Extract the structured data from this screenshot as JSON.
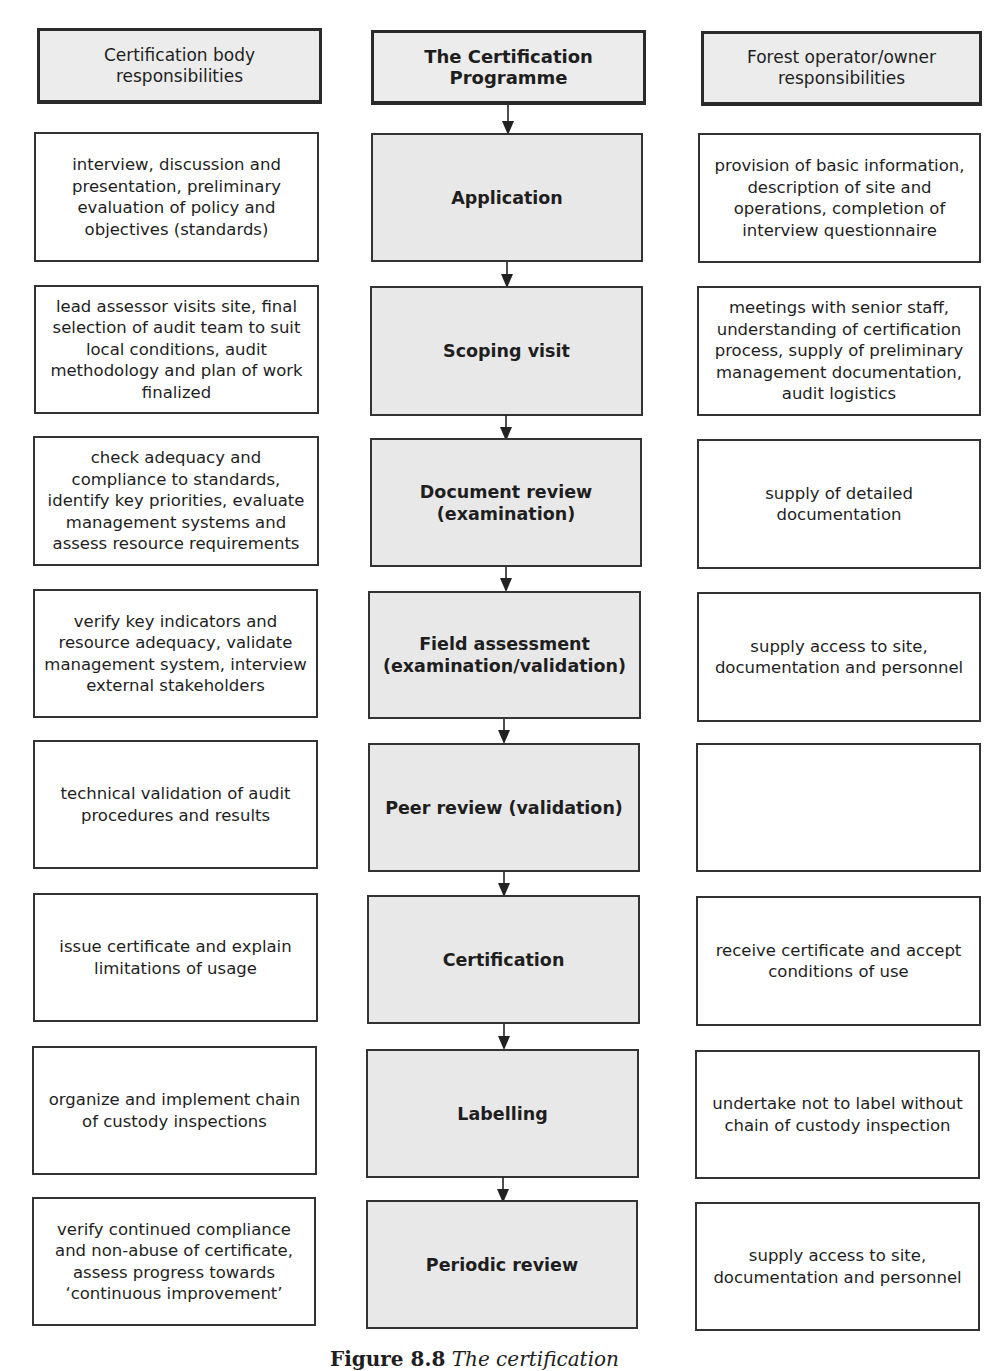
{
  "headers": {
    "left": "Certification body responsibilities",
    "center": "The Certification Programme",
    "right": "Forest operator/owner responsibilities"
  },
  "rows": [
    {
      "step": "Application",
      "certification_body": "interview, discussion and presentation, preliminary evaluation of policy and objectives (standards)",
      "forest_operator": "provision of basic information, description of site and operations, completion of interview questionnaire"
    },
    {
      "step": "Scoping visit",
      "certification_body": "lead assessor visits site, final selection of audit team to suit local conditions, audit methodology and plan of work finalized",
      "forest_operator": "meetings with senior staff, understanding of certification process, supply of preliminary management documentation, audit logistics"
    },
    {
      "step": "Document review (examination)",
      "certification_body": "check adequacy and compliance to standards, identify key priorities, evaluate management systems and assess resource requirements",
      "forest_operator": "supply of detailed documentation"
    },
    {
      "step": "Field assessment (examination/validation)",
      "certification_body": "verify key indicators and resource adequacy, validate management system, interview external stakeholders",
      "forest_operator": "supply access to site, documentation and personnel"
    },
    {
      "step": "Peer review (validation)",
      "certification_body": "technical validation of audit procedures and results",
      "forest_operator": ""
    },
    {
      "step": "Certification",
      "certification_body": "issue certificate and explain limitations of usage",
      "forest_operator": "receive certificate and accept conditions of use"
    },
    {
      "step": "Labelling",
      "certification_body": "organize and implement chain of custody inspections",
      "forest_operator": "undertake not to label without chain of custody inspection"
    },
    {
      "step": "Periodic review",
      "certification_body": "verify continued compliance and non-abuse of certificate, assess progress towards ‘continuous improvement’",
      "forest_operator": "supply access to site, documentation and personnel"
    }
  ],
  "caption": {
    "label": "Figure 8.8",
    "text": "The certification"
  }
}
